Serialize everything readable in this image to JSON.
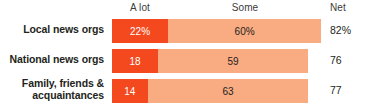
{
  "chart_data": {
    "type": "bar",
    "subtype": "stacked-horizontal",
    "title": "",
    "subtitle": "",
    "xlabel": "",
    "ylabel": "",
    "xlim": [
      0,
      100
    ],
    "grid": false,
    "legend_position": "top",
    "categories": [
      "Local news orgs",
      "National news orgs",
      "Family, friends & acquaintances"
    ],
    "series": [
      {
        "name": "A lot",
        "color": "#f4491e",
        "values": [
          22,
          18,
          14
        ]
      },
      {
        "name": "Some",
        "color": "#f9ab81",
        "values": [
          60,
          59,
          63
        ]
      }
    ],
    "net": {
      "label": "Net",
      "values": [
        82,
        76,
        77
      ]
    },
    "value_labels": {
      "a_lot": [
        "22%",
        "18",
        "14"
      ],
      "some": [
        "60%",
        "59",
        "63"
      ],
      "net": [
        "82%",
        "76",
        "77"
      ]
    }
  },
  "header": {
    "col_a_lot": "A lot",
    "col_some": "Some",
    "col_net": "Net"
  },
  "rows": [
    {
      "category": "Local news orgs",
      "a_lot_label": "22%",
      "some_label": "60%",
      "net_label": "82%",
      "a_lot_value": 22,
      "some_value": 60,
      "net_value": 82
    },
    {
      "category": "National news orgs",
      "a_lot_label": "18",
      "some_label": "59",
      "net_label": "76",
      "a_lot_value": 18,
      "some_value": 59,
      "net_value": 76
    },
    {
      "category_line1": "Family, friends &",
      "category_line2": "acquaintances",
      "a_lot_label": "14",
      "some_label": "63",
      "net_label": "77",
      "a_lot_value": 14,
      "some_value": 63,
      "net_value": 77
    }
  ],
  "colors": {
    "a_lot": "#f4491e",
    "some": "#f9ab81",
    "text": "#231f20",
    "background": "#ffffff"
  }
}
